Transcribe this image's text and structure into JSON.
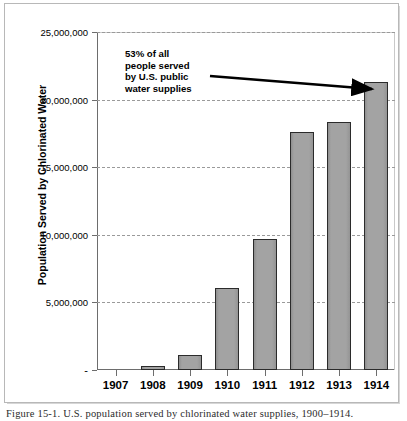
{
  "figure": {
    "caption": "Figure 15-1.   U.S. population served by chlorinated water supplies, 1900–1914."
  },
  "annotation": {
    "lines": [
      "53% of all",
      "people served",
      "by U.S. public",
      "water supplies"
    ],
    "arrow": "arrow-to-1914-bar"
  },
  "colors": {
    "bar_fill": "#9d9d9d",
    "bar_border": "#2b2b2b",
    "gridline": "#9a9a9a",
    "axis": "#6d6d6d",
    "frame": "#b8b8b8",
    "text": "#000000"
  },
  "chart_data": {
    "type": "bar",
    "title": "",
    "xlabel": "",
    "ylabel": "Population Served by Chlorinated Water",
    "categories": [
      "1907",
      "1908",
      "1909",
      "1910",
      "1911",
      "1912",
      "1913",
      "1914"
    ],
    "values": [
      0,
      300000,
      1100000,
      6100000,
      9700000,
      17600000,
      18350000,
      21300000
    ],
    "ylim": [
      0,
      25000000
    ],
    "ytick_values": [
      0,
      5000000,
      10000000,
      15000000,
      20000000,
      25000000
    ],
    "ytick_labels": [
      "-",
      "5,000,000",
      "10,000,000",
      "15,000,000",
      "20,000,000",
      "25,000,000"
    ],
    "grid": true,
    "grid_style": "dashed-horizontal",
    "legend": null,
    "legend_position": "none",
    "annotations": [
      {
        "text": "53% of all people served by U.S. public water supplies",
        "target_category": "1914",
        "style": "bold-with-arrow"
      }
    ]
  }
}
